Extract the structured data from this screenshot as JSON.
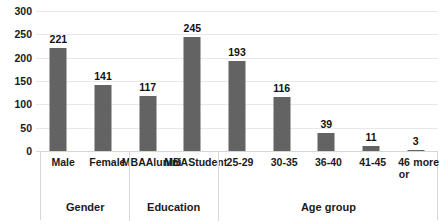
{
  "chart_data": {
    "type": "bar",
    "title": "",
    "subtitle": "",
    "xlabel": "",
    "ylabel": "",
    "ylim": [
      0,
      300
    ],
    "ytick_step": 50,
    "yticks": [
      "300",
      "250",
      "200",
      "150",
      "100",
      "50",
      "0"
    ],
    "grid": true,
    "legend": false,
    "bar_color": "#636363",
    "gridline_color": "#e8e8e8",
    "categories": [
      "Male",
      "Female",
      "MBA Alunini",
      "MBA Student",
      "25-29",
      "30-35",
      "36-40",
      "41-45",
      "46 or more"
    ],
    "category_lines": [
      [
        "Male"
      ],
      [
        "Female"
      ],
      [
        "MBA",
        "Alunini"
      ],
      [
        "MBA",
        "Student"
      ],
      [
        "25-29"
      ],
      [
        "30-35"
      ],
      [
        "36-40"
      ],
      [
        "41-45"
      ],
      [
        "46 or",
        "more"
      ]
    ],
    "values": [
      221,
      141,
      117,
      245,
      193,
      116,
      39,
      11,
      3
    ],
    "value_labels": [
      "221",
      "141",
      "117",
      "245",
      "193",
      "116",
      "39",
      "11",
      "3"
    ],
    "groups": [
      {
        "label": "Gender",
        "span": 2
      },
      {
        "label": "Education",
        "span": 2
      },
      {
        "label": "Age group",
        "span": 5
      }
    ]
  }
}
